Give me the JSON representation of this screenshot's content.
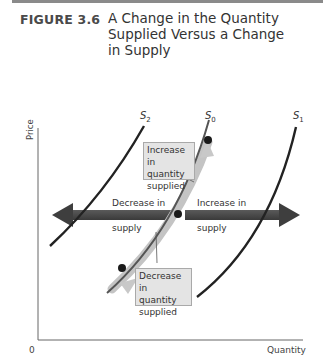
{
  "figure": {
    "label": "FIGURE 3.6",
    "title_line1": "A Change in the Quantity",
    "title_line2": "Supplied Versus a Change",
    "title_line3": "in Supply"
  },
  "axes": {
    "y_label": "Price",
    "x_label": "Quantity",
    "origin": "0"
  },
  "curves": {
    "s2": {
      "letter": "S",
      "subscript": "2"
    },
    "s0": {
      "letter": "S",
      "subscript": "0"
    },
    "s1": {
      "letter": "S",
      "subscript": "1"
    }
  },
  "callouts": {
    "increase_qs": {
      "line1": "Increase in",
      "line2": "quantity",
      "line3": "supplied"
    },
    "decrease_qs": {
      "line1": "Decrease in",
      "line2": "quantity",
      "line3": "supplied"
    }
  },
  "arrows": {
    "decrease_supply": {
      "line1": "Decrease in",
      "line2": "supply"
    },
    "increase_supply": {
      "line1": "Increase in",
      "line2": "supply"
    }
  },
  "colors": {
    "curve": "#222222",
    "arrow": "#4a4a4a",
    "glow": "#b8b8b8",
    "callout_bg": "#e4e4e4",
    "point": "#1a1a1a"
  }
}
